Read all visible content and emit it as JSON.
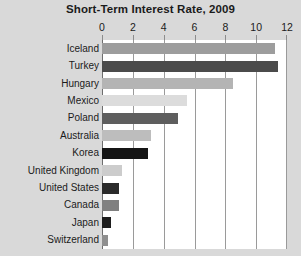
{
  "chart_data": {
    "type": "bar",
    "orientation": "horizontal",
    "title": "Short-Term Interest Rate, 2009",
    "xlabel": "",
    "ylabel": "",
    "xlim": [
      0,
      12
    ],
    "xticks": [
      0,
      2,
      4,
      6,
      8,
      10,
      12
    ],
    "xtick_labels": [
      "0",
      "2",
      "4",
      "6",
      "8",
      "10",
      "12"
    ],
    "grid": "vertical",
    "legend": "none",
    "categories": [
      "Iceland",
      "Turkey",
      "Hungary",
      "Mexico",
      "Poland",
      "Australia",
      "Korea",
      "United Kingdom",
      "United States",
      "Canada",
      "Japan",
      "Switzerland"
    ],
    "values": [
      11.2,
      11.4,
      8.5,
      5.5,
      4.9,
      3.2,
      3.0,
      1.3,
      1.1,
      1.1,
      0.6,
      0.4
    ],
    "bar_colors": [
      "#9d9d9d",
      "#4b4b4b",
      "#b4b4b4",
      "#dcdcdc",
      "#5e5e5e",
      "#bdbdbd",
      "#151515",
      "#cccccc",
      "#2b2b2b",
      "#808080",
      "#1d1d1d",
      "#8f8f8f"
    ]
  },
  "colors": {
    "page_background": "#d9d9d9",
    "plot_background": "#ffffff",
    "gridline": "#9a9a9a",
    "text": "#1b1b1b"
  }
}
